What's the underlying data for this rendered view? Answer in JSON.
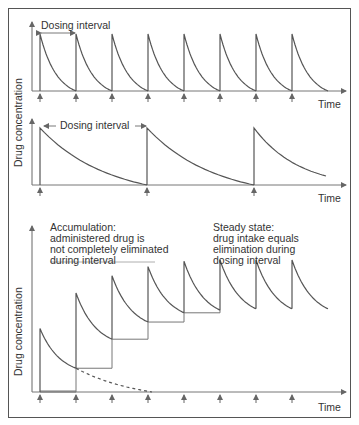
{
  "figure": {
    "frame_color": "#555555",
    "line_color": "#555555",
    "axis_color": "#666666"
  },
  "panels": {
    "top": {
      "annotation": "Dosing interval",
      "x_label": "Time",
      "description": "Short dosing interval: each dose fully eliminated before the next"
    },
    "middle": {
      "annotation": "Dosing interval",
      "x_label": "Time",
      "description": "Long dosing interval: slow elimination over a longer interval"
    },
    "shared_y_label": "Drug concentration",
    "bottom": {
      "y_label": "Drug concentration",
      "x_label": "Time",
      "accumulation": {
        "line1": "Accumulation:",
        "line2": "administered drug is",
        "line3": "not completely eliminated",
        "line4": "during interval"
      },
      "steady_state": {
        "line1": "Steady state:",
        "line2": "drug intake equals",
        "line3": "elimination during",
        "line4": "dosing interval"
      }
    }
  },
  "chart_data": [
    {
      "type": "line",
      "title": "",
      "xlabel": "Time",
      "ylabel": "Drug concentration",
      "annotation": "Dosing interval",
      "dose_times": [
        1,
        2,
        3,
        4,
        5,
        6,
        7,
        8
      ],
      "peak": 1.0,
      "trough": 0.0,
      "note": "Each dose decays to zero before next dose"
    },
    {
      "type": "line",
      "title": "",
      "xlabel": "Time",
      "ylabel": "Drug concentration",
      "annotation": "Dosing interval",
      "dose_times": [
        1,
        4,
        7
      ],
      "peak": 1.0,
      "trough": 0.0,
      "note": "Longer dosing interval, slow decay to zero"
    },
    {
      "type": "line",
      "title": "",
      "xlabel": "Time",
      "ylabel": "Drug concentration",
      "dose_times": [
        1,
        2,
        3,
        4,
        5,
        6,
        7,
        8
      ],
      "peaks": [
        0.48,
        0.75,
        0.88,
        0.95,
        0.99,
        1.0,
        1.0,
        1.0
      ],
      "troughs": [
        0.18,
        0.4,
        0.53,
        0.6,
        0.62,
        0.63,
        0.63,
        0.63
      ],
      "annotations": [
        "Accumulation: administered drug is not completely eliminated during interval",
        "Steady state: drug intake equals elimination during dosing interval"
      ],
      "note": "Dashed line shows elimination of first dose alone"
    }
  ]
}
